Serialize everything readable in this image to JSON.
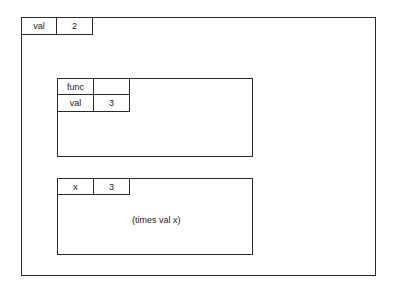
{
  "outer_environment": {
    "bindings": [
      {
        "name": "val",
        "value": "2"
      }
    ]
  },
  "procedure_frame": {
    "bindings": [
      {
        "name": "func",
        "value": ""
      },
      {
        "name": "val",
        "value": "3"
      }
    ]
  },
  "application_frame": {
    "bindings": [
      {
        "name": "x",
        "value": "3"
      }
    ],
    "body": "(times val x)"
  }
}
